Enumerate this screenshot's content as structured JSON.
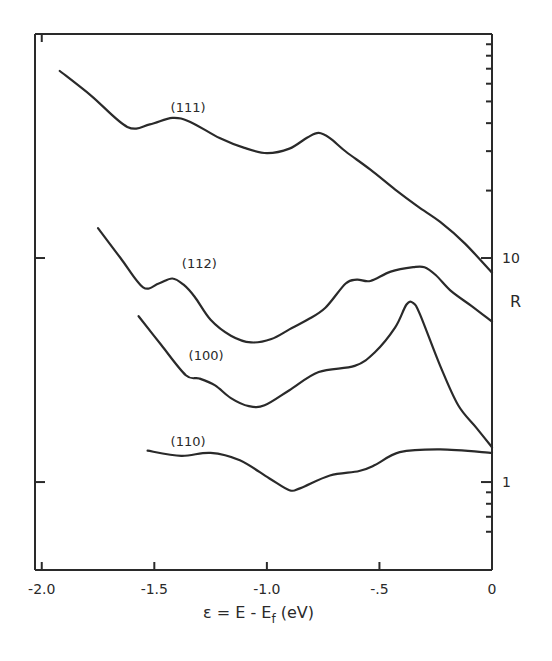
{
  "chart_data": {
    "type": "line",
    "title": "",
    "xlabel": "ε = E - E_f (eV)",
    "xlabel_main": "ε = E - E",
    "xlabel_sub": "f",
    "xlabel_unit": " (eV)",
    "ylabel": "R",
    "xlim": [
      -2.03,
      0
    ],
    "ylim": [
      0.405,
      100
    ],
    "yscale": "log",
    "grid": false,
    "y_axis_side": "right",
    "x_ticks": [
      -2.0,
      -1.5,
      -1.0,
      -0.5,
      0
    ],
    "x_tick_labels": [
      "-2.0",
      "-1.5",
      "-1.0",
      "-.5",
      "0"
    ],
    "y_major_ticks": [
      1,
      10
    ],
    "y_tick_labels": [
      "1",
      "10"
    ],
    "y_minor_ticks": [
      0.6,
      0.7,
      0.8,
      0.9,
      20,
      30,
      40,
      50,
      60,
      70,
      80,
      90
    ],
    "series": [
      {
        "name": "(111)",
        "label_at": {
          "x": -1.35,
          "y": 45
        },
        "x": [
          -1.92,
          -1.78,
          -1.62,
          -1.52,
          -1.42,
          -1.34,
          -1.21,
          -1.1,
          -1.0,
          -0.9,
          -0.82,
          -0.77,
          -0.72,
          -0.65,
          -0.54,
          -0.43,
          -0.33,
          -0.23,
          -0.12,
          0.0
        ],
        "y": [
          68.4,
          53.0,
          38.5,
          39.5,
          42.2,
          40.5,
          34.3,
          31.0,
          29.4,
          30.8,
          34.5,
          36.2,
          34.3,
          29.9,
          24.8,
          20.2,
          17.0,
          14.5,
          11.6,
          8.6
        ]
      },
      {
        "name": "(112)",
        "label_at": {
          "x": -1.3,
          "y": 9.0
        },
        "x": [
          -1.75,
          -1.65,
          -1.55,
          -1.48,
          -1.42,
          -1.37,
          -1.32,
          -1.25,
          -1.16,
          -1.07,
          -0.98,
          -0.9,
          -0.82,
          -0.74,
          -0.65,
          -0.6,
          -0.54,
          -0.45,
          -0.35,
          -0.3,
          -0.25,
          -0.18,
          -0.09,
          0.0
        ],
        "y": [
          13.6,
          10.0,
          7.4,
          7.7,
          8.1,
          7.6,
          6.7,
          5.3,
          4.5,
          4.2,
          4.35,
          4.8,
          5.3,
          6.0,
          7.7,
          8.0,
          7.9,
          8.7,
          9.1,
          9.1,
          8.4,
          7.1,
          6.1,
          5.2
        ]
      },
      {
        "name": "(100)",
        "label_at": {
          "x": -1.27,
          "y": 3.5
        },
        "x": [
          -1.57,
          -1.47,
          -1.36,
          -1.3,
          -1.23,
          -1.16,
          -1.08,
          -1.01,
          -0.9,
          -0.77,
          -0.61,
          -0.52,
          -0.43,
          -0.38,
          -0.35,
          -0.32,
          -0.23,
          -0.15,
          -0.07,
          0.0
        ],
        "y": [
          5.5,
          4.1,
          3.0,
          2.9,
          2.7,
          2.37,
          2.18,
          2.2,
          2.57,
          3.1,
          3.3,
          3.8,
          4.9,
          6.2,
          6.3,
          5.6,
          3.3,
          2.2,
          1.75,
          1.43
        ]
      },
      {
        "name": "(110)",
        "label_at": {
          "x": -1.35,
          "y": 1.45
        },
        "x": [
          -1.53,
          -1.38,
          -1.25,
          -1.12,
          -0.99,
          -0.9,
          -0.85,
          -0.72,
          -0.59,
          -0.52,
          -0.41,
          -0.23,
          0.0
        ],
        "y": [
          1.38,
          1.31,
          1.35,
          1.25,
          1.04,
          0.92,
          0.94,
          1.07,
          1.12,
          1.19,
          1.36,
          1.4,
          1.35
        ]
      }
    ]
  }
}
